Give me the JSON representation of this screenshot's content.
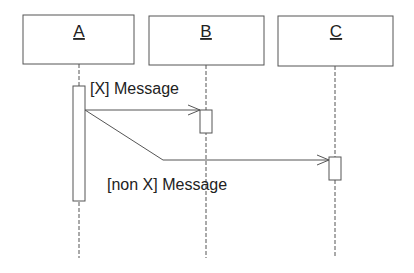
{
  "diagram": {
    "type": "sequence",
    "colors": {
      "line": "#555555",
      "text": "#222222",
      "background": "#ffffff"
    },
    "objects": [
      {
        "id": "A",
        "label": "A",
        "x": 23,
        "y": 15,
        "w": 111,
        "h": 49,
        "lifeline_x": 79
      },
      {
        "id": "B",
        "label": "B",
        "x": 149,
        "y": 16,
        "w": 115,
        "h": 49,
        "lifeline_x": 206
      },
      {
        "id": "C",
        "label": "C",
        "x": 278,
        "y": 16,
        "w": 115,
        "h": 50,
        "lifeline_x": 335
      }
    ],
    "lifeline_end_y": 258,
    "activations": [
      {
        "object": "A",
        "x": 73,
        "y": 86,
        "w": 12,
        "h": 115
      },
      {
        "object": "B",
        "x": 200,
        "y": 110,
        "w": 12,
        "h": 23
      },
      {
        "object": "C",
        "x": 329,
        "y": 157,
        "w": 12,
        "h": 23
      }
    ],
    "messages": [
      {
        "from": "A",
        "to": "B",
        "label": "[X] Message",
        "guard": "X"
      },
      {
        "from": "A",
        "to": "C",
        "label": "[non X] Message",
        "guard": "non X"
      }
    ]
  }
}
